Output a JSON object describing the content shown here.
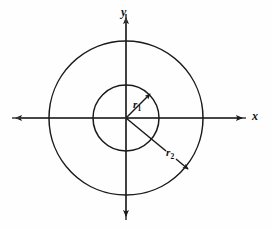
{
  "figure": {
    "background_color": "#fefefe",
    "stroke_color": "#1a1a1a",
    "width": 272,
    "height": 229
  },
  "axes": {
    "origin": {
      "x": 126,
      "y": 118
    },
    "x_axis": {
      "label": "x",
      "left_arrow_tip_x": 12,
      "right_arrow_tip_x": 246,
      "y": 118
    },
    "y_axis": {
      "label": "y",
      "top_arrow_tip_y": 14,
      "bottom_arrow_tip_y": 220,
      "x": 126
    }
  },
  "circles": [
    {
      "name": "inner-circle",
      "radius": 33,
      "cx": 126,
      "cy": 118
    },
    {
      "name": "outer-circle",
      "radius": 77,
      "cx": 126,
      "cy": 118
    }
  ],
  "radii": [
    {
      "name": "r1",
      "label_base": "r",
      "label_sub": "1",
      "from": {
        "x": 126,
        "y": 118
      },
      "to": {
        "x": 153,
        "y": 91
      },
      "arrow": true,
      "describes": "inner-circle"
    },
    {
      "name": "r2",
      "label_base": "r",
      "label_sub": "2",
      "from": {
        "x": 126,
        "y": 118
      },
      "to": {
        "x": 191,
        "y": 171
      },
      "arrow": true,
      "describes": "outer-circle"
    }
  ]
}
